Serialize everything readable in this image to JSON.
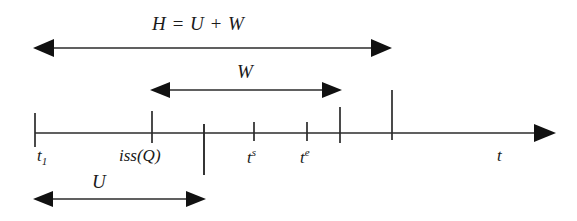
{
  "figure": {
    "type": "timeline-diagram",
    "background_color": "#ffffff",
    "line_color": "#2b2b2b",
    "text_color": "#1a1a1a",
    "width": 577,
    "height": 221,
    "axis": {
      "name": "time-axis",
      "label": "t",
      "y": 133,
      "x_start": 35,
      "x_end": 552,
      "arrow_head": "right"
    },
    "equation": {
      "text": "H = U + W",
      "x": 152,
      "y": 18
    },
    "spans": [
      {
        "id": "H",
        "label": "H = U + W",
        "label_x": 152,
        "label_y": 18,
        "arrow_y": 48,
        "x_start": 35,
        "x_end": 390,
        "heads": "both"
      },
      {
        "id": "W",
        "label": "W",
        "label_x": 237,
        "label_y": 63,
        "arrow_y": 90,
        "x_start": 152,
        "x_end": 340,
        "heads": "both"
      },
      {
        "id": "U",
        "label": "U",
        "label_x": 92,
        "label_y": 173,
        "arrow_y": 199,
        "x_start": 35,
        "x_end": 203,
        "heads": "both"
      }
    ],
    "ticks": [
      {
        "id": "t1",
        "x": 35,
        "top": 113,
        "bottom": 147,
        "label": "t",
        "sublabel": "1",
        "suplabel": "",
        "label_x": 37,
        "label_y": 150
      },
      {
        "id": "issQ",
        "x": 152,
        "top": 111,
        "bottom": 143,
        "label": "iss(Q)",
        "sublabel": "",
        "suplabel": "",
        "label_x": 119,
        "label_y": 150
      },
      {
        "id": "u_end",
        "x": 204,
        "top": 124,
        "bottom": 175,
        "label": "",
        "sublabel": "",
        "suplabel": "",
        "label_x": 0,
        "label_y": 0
      },
      {
        "id": "ts",
        "x": 254,
        "top": 122,
        "bottom": 141,
        "label": "t",
        "sublabel": "",
        "suplabel": "s",
        "label_x": 247,
        "label_y": 150
      },
      {
        "id": "te",
        "x": 307,
        "top": 122,
        "bottom": 141,
        "label": "t",
        "sublabel": "",
        "suplabel": "e",
        "label_x": 300,
        "label_y": 150
      },
      {
        "id": "w_end",
        "x": 340,
        "top": 107,
        "bottom": 143,
        "label": "",
        "sublabel": "",
        "suplabel": "",
        "label_x": 0,
        "label_y": 0
      },
      {
        "id": "h_end",
        "x": 392,
        "top": 90,
        "bottom": 140,
        "label": "",
        "sublabel": "",
        "suplabel": "",
        "label_x": 0,
        "label_y": 0
      }
    ],
    "axis_label": {
      "text": "t",
      "x": 497,
      "y": 150
    }
  }
}
